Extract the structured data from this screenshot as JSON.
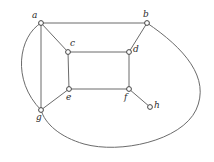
{
  "figure": {
    "kind": "undirected-graph-drawing",
    "background_color": "#ffffff",
    "edge_color": "#6b6b6b",
    "vertex_stroke_color": "#444444",
    "vertex_fill_color": "#ffffff",
    "label_color": "#2b2b2b",
    "width": 214,
    "height": 162
  },
  "vertices": [
    {
      "id": "a",
      "label": "a",
      "x": 41,
      "y": 23,
      "label_x": 32,
      "label_y": 11
    },
    {
      "id": "b",
      "label": "b",
      "x": 147,
      "y": 23,
      "label_x": 143,
      "label_y": 10
    },
    {
      "id": "c",
      "label": "c",
      "x": 68,
      "y": 52,
      "label_x": 70,
      "label_y": 39
    },
    {
      "id": "d",
      "label": "d",
      "x": 129,
      "y": 52,
      "label_x": 133,
      "label_y": 45
    },
    {
      "id": "e",
      "label": "e",
      "x": 69,
      "y": 89,
      "label_x": 66,
      "label_y": 93
    },
    {
      "id": "f",
      "label": "f",
      "x": 129,
      "y": 89,
      "label_x": 124,
      "label_y": 93
    },
    {
      "id": "g",
      "label": "g",
      "x": 41,
      "y": 110,
      "label_x": 36,
      "label_y": 113
    },
    {
      "id": "h",
      "label": "h",
      "x": 150,
      "y": 107,
      "label_x": 154,
      "label_y": 101
    }
  ],
  "edges": [
    {
      "id": "a-b",
      "from": "a",
      "to": "b",
      "shape": "line",
      "path": "M 41 23 L 147 23"
    },
    {
      "id": "a-c",
      "from": "a",
      "to": "c",
      "shape": "line",
      "path": "M 41 23 L 68 52"
    },
    {
      "id": "a-g",
      "from": "a",
      "to": "g",
      "shape": "line",
      "path": "M 41 23 L 41 110"
    },
    {
      "id": "a-g-arc",
      "from": "a",
      "to": "g",
      "shape": "curve",
      "path": "M 41 23 C 19 36 11 80 41 110"
    },
    {
      "id": "b-d",
      "from": "b",
      "to": "d",
      "shape": "line",
      "path": "M 147 23 L 129 52"
    },
    {
      "id": "b-g-outer",
      "from": "b",
      "to": "g",
      "shape": "curve",
      "path": "M 147 23 C 184 48 211 78 196 110 C 181 141 120 154 84 144 C 60 137 45 124 41 110"
    },
    {
      "id": "c-d",
      "from": "c",
      "to": "d",
      "shape": "line",
      "path": "M 68 52 L 129 52"
    },
    {
      "id": "c-e",
      "from": "c",
      "to": "e",
      "shape": "line",
      "path": "M 68 52 L 69 89"
    },
    {
      "id": "d-f",
      "from": "d",
      "to": "f",
      "shape": "line",
      "path": "M 129 52 L 129 89"
    },
    {
      "id": "e-f",
      "from": "e",
      "to": "f",
      "shape": "line",
      "path": "M 69 89 L 129 89"
    },
    {
      "id": "e-g",
      "from": "e",
      "to": "g",
      "shape": "line",
      "path": "M 69 89 L 41 110"
    },
    {
      "id": "f-h",
      "from": "f",
      "to": "h",
      "shape": "line",
      "path": "M 129 89 L 150 107"
    }
  ],
  "vertex_radius": 2.4
}
